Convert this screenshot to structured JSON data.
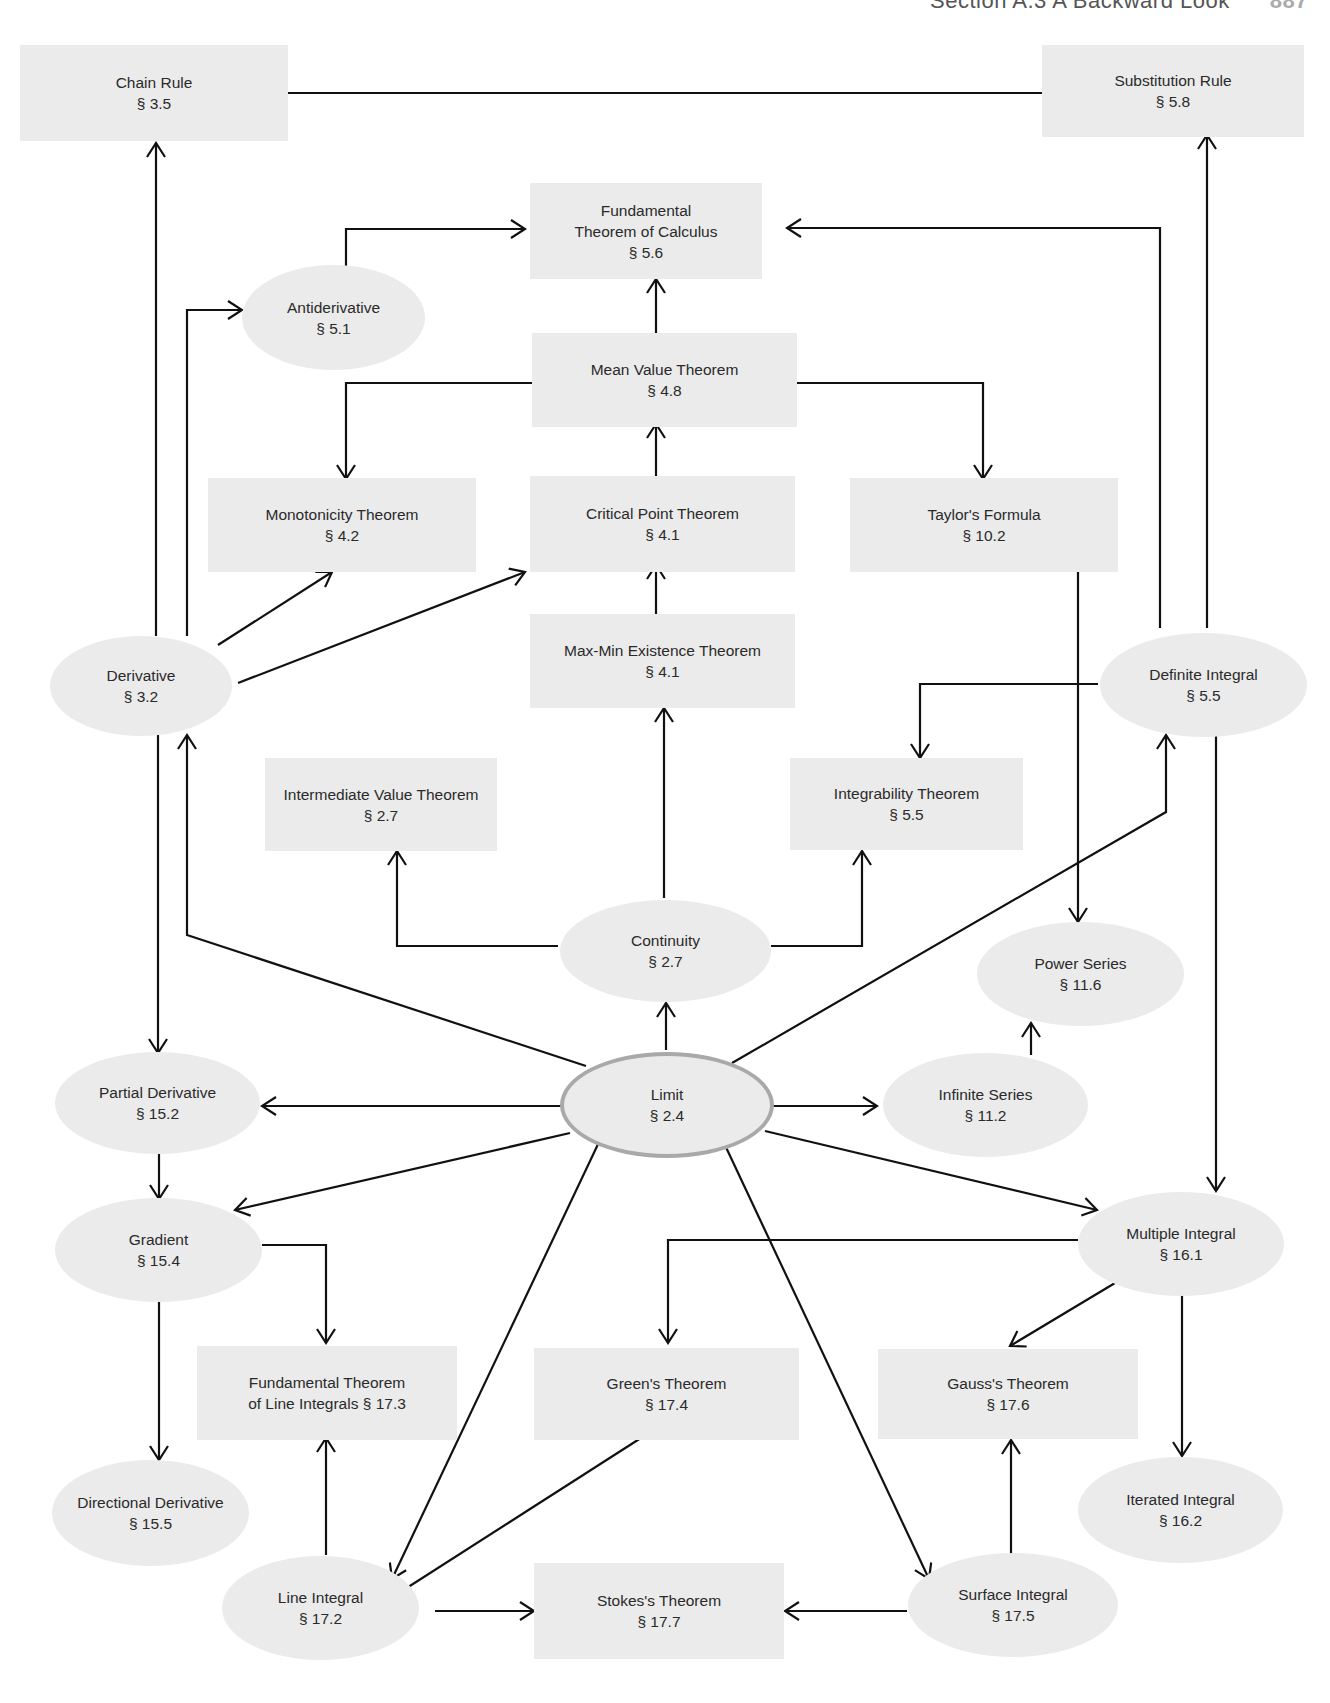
{
  "running_head": {
    "text": "Section A.3  A Backward Look",
    "page": "887"
  },
  "colors": {
    "node_fill": "#ebebeb",
    "edge": "#111111",
    "limit_border": "#a9a9a9"
  },
  "nodes": {
    "chain_rule": {
      "title": "Chain Rule",
      "section": "§ 3.5",
      "shape": "box"
    },
    "substitution": {
      "title": "Substitution Rule",
      "section": "§ 5.8",
      "shape": "box"
    },
    "ftc": {
      "title": "Fundamental\nTheorem of Calculus",
      "section": "§ 5.6",
      "shape": "box"
    },
    "antiderivative": {
      "title": "Antiderivative",
      "section": "§ 5.1",
      "shape": "ellipse"
    },
    "mvt": {
      "title": "Mean Value Theorem",
      "section": "§ 4.8",
      "shape": "box"
    },
    "monotonicity": {
      "title": "Monotonicity Theorem",
      "section": "§ 4.2",
      "shape": "box"
    },
    "critical": {
      "title": "Critical Point Theorem",
      "section": "§ 4.1",
      "shape": "box"
    },
    "taylor": {
      "title": "Taylor's Formula",
      "section": "§ 10.2",
      "shape": "box"
    },
    "derivative": {
      "title": "Derivative",
      "section": "§ 3.2",
      "shape": "ellipse"
    },
    "maxmin": {
      "title": "Max-Min Existence Theorem",
      "section": "§ 4.1",
      "shape": "box"
    },
    "definite": {
      "title": "Definite Integral",
      "section": "§ 5.5",
      "shape": "ellipse"
    },
    "ivt": {
      "title": "Intermediate Value Theorem",
      "section": "§ 2.7",
      "shape": "box"
    },
    "integrability": {
      "title": "Integrability Theorem",
      "section": "§ 5.5",
      "shape": "box"
    },
    "continuity": {
      "title": "Continuity",
      "section": "§ 2.7",
      "shape": "ellipse"
    },
    "power_series": {
      "title": "Power Series",
      "section": "§ 11.6",
      "shape": "ellipse"
    },
    "partial": {
      "title": "Partial Derivative",
      "section": "§ 15.2",
      "shape": "ellipse"
    },
    "limit": {
      "title": "Limit",
      "section": "§ 2.4",
      "shape": "ellipse"
    },
    "infinite_series": {
      "title": "Infinite Series",
      "section": "§ 11.2",
      "shape": "ellipse"
    },
    "gradient": {
      "title": "Gradient",
      "section": "§ 15.4",
      "shape": "ellipse"
    },
    "multiple": {
      "title": "Multiple Integral",
      "section": "§ 16.1",
      "shape": "ellipse"
    },
    "ftli": {
      "title": "Fundamental Theorem\nof Line Integrals § 17.3",
      "section": "",
      "shape": "box"
    },
    "green": {
      "title": "Green's Theorem",
      "section": "§ 17.4",
      "shape": "box"
    },
    "gauss": {
      "title": "Gauss's Theorem",
      "section": "§ 17.6",
      "shape": "box"
    },
    "directional": {
      "title": "Directional Derivative",
      "section": "§ 15.5",
      "shape": "ellipse"
    },
    "iterated": {
      "title": "Iterated Integral",
      "section": "§ 16.2",
      "shape": "ellipse"
    },
    "line_integral": {
      "title": "Line Integral",
      "section": "§ 17.2",
      "shape": "ellipse"
    },
    "stokes": {
      "title": "Stokes's Theorem",
      "section": "§ 17.7",
      "shape": "box"
    },
    "surface": {
      "title": "Surface Integral",
      "section": "§ 17.5",
      "shape": "ellipse"
    }
  },
  "edges": [
    {
      "from": "Chain Rule",
      "to": "Substitution Rule"
    },
    {
      "from": "Derivative",
      "to": "Chain Rule"
    },
    {
      "from": "Derivative",
      "to": "Antiderivative"
    },
    {
      "from": "Antiderivative",
      "to": "Fundamental Theorem of Calculus"
    },
    {
      "from": "Mean Value Theorem",
      "to": "Fundamental Theorem of Calculus"
    },
    {
      "from": "Definite Integral",
      "to": "Fundamental Theorem of Calculus"
    },
    {
      "from": "Definite Integral",
      "to": "Substitution Rule"
    },
    {
      "from": "Mean Value Theorem",
      "to": "Monotonicity Theorem"
    },
    {
      "from": "Mean Value Theorem",
      "to": "Taylor's Formula"
    },
    {
      "from": "Critical Point Theorem",
      "to": "Mean Value Theorem"
    },
    {
      "from": "Derivative",
      "to": "Monotonicity Theorem"
    },
    {
      "from": "Derivative",
      "to": "Critical Point Theorem"
    },
    {
      "from": "Max-Min Existence Theorem",
      "to": "Critical Point Theorem"
    },
    {
      "from": "Taylor's Formula",
      "to": "Power Series"
    },
    {
      "from": "Definite Integral",
      "to": "Integrability Theorem"
    },
    {
      "from": "Continuity",
      "to": "Max-Min Existence Theorem"
    },
    {
      "from": "Continuity",
      "to": "Intermediate Value Theorem"
    },
    {
      "from": "Continuity",
      "to": "Integrability Theorem"
    },
    {
      "from": "Limit",
      "to": "Continuity"
    },
    {
      "from": "Limit",
      "to": "Derivative"
    },
    {
      "from": "Limit",
      "to": "Definite Integral"
    },
    {
      "from": "Limit",
      "to": "Partial Derivative"
    },
    {
      "from": "Limit",
      "to": "Infinite Series"
    },
    {
      "from": "Infinite Series",
      "to": "Power Series"
    },
    {
      "from": "Derivative",
      "to": "Partial Derivative"
    },
    {
      "from": "Partial Derivative",
      "to": "Gradient"
    },
    {
      "from": "Limit",
      "to": "Gradient"
    },
    {
      "from": "Limit",
      "to": "Multiple Integral"
    },
    {
      "from": "Definite Integral",
      "to": "Multiple Integral"
    },
    {
      "from": "Gradient",
      "to": "Fundamental Theorem of Line Integrals"
    },
    {
      "from": "Gradient",
      "to": "Directional Derivative"
    },
    {
      "from": "Multiple Integral",
      "to": "Green's Theorem"
    },
    {
      "from": "Multiple Integral",
      "to": "Gauss's Theorem"
    },
    {
      "from": "Multiple Integral",
      "to": "Iterated Integral"
    },
    {
      "from": "Limit",
      "to": "Line Integral"
    },
    {
      "from": "Limit",
      "to": "Surface Integral"
    },
    {
      "from": "Line Integral",
      "to": "Fundamental Theorem of Line Integrals"
    },
    {
      "from": "Line Integral",
      "to": "Green's Theorem"
    },
    {
      "from": "Line Integral",
      "to": "Stokes's Theorem"
    },
    {
      "from": "Surface Integral",
      "to": "Stokes's Theorem"
    },
    {
      "from": "Surface Integral",
      "to": "Gauss's Theorem"
    }
  ]
}
